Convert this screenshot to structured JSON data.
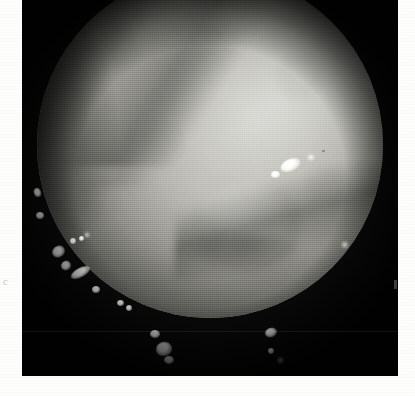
{
  "figure": {
    "panel_letter": "c",
    "modality": "endoscopic-photograph",
    "color_mode": "grayscale",
    "frame_background_color": "#0a0a0a",
    "page_background_color": "#fdfdfc",
    "tissue_mid_tone_color": "#b0b0a9",
    "tissue_bright_tone_color": "#cfcfc9",
    "tissue_shadow_tone_color": "#6d6d68",
    "highlight_color": "#ffffff"
  },
  "frame": {
    "left": 22,
    "top": 0,
    "width": 376,
    "height": 376
  },
  "field_of_view": {
    "shape": "circle",
    "left": 15,
    "top": -28,
    "diameter": 346
  },
  "anatomy": {
    "features": [
      {
        "name": "mucosal-fold-crease-upper-left",
        "region": "upper-left",
        "kind": "fold"
      },
      {
        "name": "mucosal-fold-crease-secondary",
        "region": "upper-left",
        "kind": "fold"
      },
      {
        "name": "haustral-fold-lower-right",
        "region": "lower-right",
        "kind": "fold"
      },
      {
        "name": "polypoid-mound",
        "region": "lower-centre",
        "kind": "bulge"
      },
      {
        "name": "illumination-pool",
        "region": "upper-right",
        "kind": "light"
      }
    ]
  },
  "specular_highlights": [
    {
      "id": 1,
      "x": 12,
      "y": 188,
      "w": 7,
      "h": 9,
      "rot": -20,
      "soft": false
    },
    {
      "id": 2,
      "x": 14,
      "y": 212,
      "w": 8,
      "h": 7,
      "rot": 0,
      "soft": false
    },
    {
      "id": 3,
      "x": 48,
      "y": 238,
      "w": 6,
      "h": 6,
      "rot": 0,
      "soft": false
    },
    {
      "id": 4,
      "x": 57,
      "y": 236,
      "w": 5,
      "h": 5,
      "rot": 0,
      "soft": false
    },
    {
      "id": 5,
      "x": 30,
      "y": 246,
      "w": 13,
      "h": 11,
      "rot": -34,
      "soft": false
    },
    {
      "id": 6,
      "x": 39,
      "y": 261,
      "w": 10,
      "h": 9,
      "rot": -30,
      "soft": false
    },
    {
      "id": 7,
      "x": 48,
      "y": 268,
      "w": 21,
      "h": 9,
      "rot": -28,
      "soft": false
    },
    {
      "id": 8,
      "x": 70,
      "y": 286,
      "w": 8,
      "h": 7,
      "rot": 0,
      "soft": false
    },
    {
      "id": 9,
      "x": 95,
      "y": 300,
      "w": 7,
      "h": 6,
      "rot": 0,
      "soft": false
    },
    {
      "id": 10,
      "x": 104,
      "y": 305,
      "w": 6,
      "h": 6,
      "rot": 0,
      "soft": false
    },
    {
      "id": 11,
      "x": 63,
      "y": 233,
      "w": 4,
      "h": 4,
      "rot": 0,
      "soft": true
    },
    {
      "id": 12,
      "x": 258,
      "y": 159,
      "w": 21,
      "h": 12,
      "rot": -24,
      "soft": false
    },
    {
      "id": 13,
      "x": 249,
      "y": 171,
      "w": 9,
      "h": 7,
      "rot": 0,
      "soft": false
    },
    {
      "id": 14,
      "x": 286,
      "y": 155,
      "w": 6,
      "h": 5,
      "rot": 0,
      "soft": true
    },
    {
      "id": 15,
      "x": 320,
      "y": 242,
      "w": 6,
      "h": 6,
      "rot": 0,
      "soft": true
    },
    {
      "id": 16,
      "x": 128,
      "y": 330,
      "w": 10,
      "h": 8,
      "rot": 0,
      "soft": false
    },
    {
      "id": 17,
      "x": 134,
      "y": 342,
      "w": 16,
      "h": 14,
      "rot": -12,
      "soft": false
    },
    {
      "id": 18,
      "x": 142,
      "y": 356,
      "w": 10,
      "h": 8,
      "rot": 0,
      "soft": false
    },
    {
      "id": 19,
      "x": 243,
      "y": 328,
      "w": 12,
      "h": 9,
      "rot": -18,
      "soft": false
    },
    {
      "id": 20,
      "x": 246,
      "y": 348,
      "w": 6,
      "h": 6,
      "rot": 0,
      "soft": false
    },
    {
      "id": 21,
      "x": 256,
      "y": 358,
      "w": 5,
      "h": 5,
      "rot": 0,
      "soft": true
    }
  ]
}
